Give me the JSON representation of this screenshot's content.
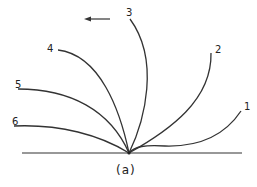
{
  "diagram": {
    "stroke_color": "#333333",
    "origin": [
      129,
      153
    ],
    "baseline": {
      "x1": 22,
      "x2": 242,
      "y": 153
    },
    "arrow": {
      "from": [
        110,
        19
      ],
      "to": [
        84,
        19
      ],
      "direction": "left"
    },
    "curves": [
      {
        "label": "1",
        "label_pos": [
          244,
          102
        ],
        "path": "M129,153 C135,146 145,145 165,146 C200,147 225,135 241,111"
      },
      {
        "label": "2",
        "label_pos": [
          215,
          45
        ],
        "path": "M129,153 C170,130 212,100 211,53"
      },
      {
        "label": "3",
        "label_pos": [
          126,
          8
        ],
        "path": "M129,153 C145,120 160,60 130,19"
      },
      {
        "label": "4",
        "label_pos": [
          47,
          44
        ],
        "path": "M129,153 C120,110 100,55 58,50"
      },
      {
        "label": "5",
        "label_pos": [
          15,
          80
        ],
        "path": "M129,153 C110,110 70,89 18,89"
      },
      {
        "label": "6",
        "label_pos": [
          12,
          117
        ],
        "path": "M129,153 C100,135 60,124 14,126"
      }
    ],
    "caption": "(a)"
  }
}
